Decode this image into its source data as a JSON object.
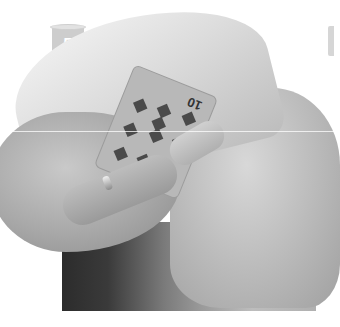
{
  "image": {
    "description": "Black-and-white photo of two hands concealing a playing card under a cloth",
    "step_badge": {
      "number": "5",
      "color": "#cdcdcd",
      "text_color": "#ffffff"
    },
    "card": {
      "rank": "10",
      "suit": "diamonds",
      "pips": 10
    },
    "palette": {
      "background": "#ffffff",
      "dark_backdrop": "#2c2c2c",
      "skin_tone_mid": "#bcbcbc"
    }
  }
}
